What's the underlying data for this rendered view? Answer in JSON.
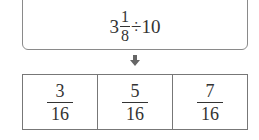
{
  "expression": {
    "whole": "3",
    "numerator": "1",
    "denominator": "8",
    "operator": "÷",
    "divisor": "10"
  },
  "arrow_icon": "down-arrow-icon",
  "choices": [
    {
      "numerator": "3",
      "denominator": "16"
    },
    {
      "numerator": "5",
      "denominator": "16"
    },
    {
      "numerator": "7",
      "denominator": "16"
    }
  ]
}
